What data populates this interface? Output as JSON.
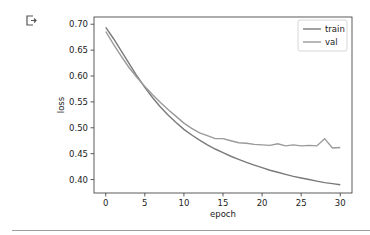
{
  "cell": {
    "output_icon": "cell-output-icon"
  },
  "chart_data": {
    "type": "line",
    "title": "",
    "xlabel": "epoch",
    "ylabel": "loss",
    "xlim": [
      -1.5,
      31.5
    ],
    "ylim": [
      0.374,
      0.714
    ],
    "xticks": [
      0,
      5,
      10,
      15,
      20,
      25,
      30
    ],
    "xtick_labels": [
      "0",
      "5",
      "10",
      "15",
      "20",
      "25",
      "30"
    ],
    "yticks": [
      0.4,
      0.45,
      0.5,
      0.55,
      0.6,
      0.65,
      0.7
    ],
    "ytick_labels": [
      "0.40",
      "0.45",
      "0.50",
      "0.55",
      "0.60",
      "0.65",
      "0.70"
    ],
    "grid": false,
    "legend_position": "top-right",
    "x": [
      0,
      1,
      2,
      3,
      4,
      5,
      6,
      7,
      8,
      9,
      10,
      11,
      12,
      13,
      14,
      15,
      16,
      17,
      18,
      19,
      20,
      21,
      22,
      23,
      24,
      25,
      26,
      27,
      28,
      29,
      30
    ],
    "series": [
      {
        "name": "train",
        "color": "#7a7a7a",
        "values": [
          0.694,
          0.672,
          0.648,
          0.624,
          0.6,
          0.578,
          0.558,
          0.54,
          0.524,
          0.51,
          0.497,
          0.486,
          0.476,
          0.467,
          0.459,
          0.452,
          0.445,
          0.439,
          0.433,
          0.428,
          0.423,
          0.418,
          0.414,
          0.41,
          0.406,
          0.403,
          0.4,
          0.397,
          0.394,
          0.392,
          0.39
        ]
      },
      {
        "name": "val",
        "color": "#9a9a9a",
        "values": [
          0.686,
          0.661,
          0.638,
          0.616,
          0.597,
          0.58,
          0.564,
          0.549,
          0.535,
          0.522,
          0.509,
          0.499,
          0.49,
          0.485,
          0.479,
          0.479,
          0.475,
          0.471,
          0.47,
          0.468,
          0.467,
          0.466,
          0.469,
          0.465,
          0.467,
          0.465,
          0.466,
          0.465,
          0.479,
          0.461,
          0.462
        ]
      }
    ]
  }
}
